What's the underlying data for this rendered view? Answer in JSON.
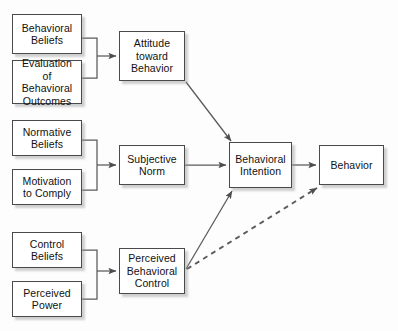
{
  "diagram": {
    "canvas": {
      "width": 398,
      "height": 331,
      "background": "#fdfdfd"
    },
    "style": {
      "box_border_color": "#4a4a4a",
      "box_fill": "#ffffff",
      "edge_color": "#555555",
      "text_color": "#111111",
      "shadow_color": "#969696"
    },
    "nodes": [
      {
        "id": "behavioral-beliefs",
        "label": "Behavioral\nBeliefs",
        "line1": "Behavioral",
        "line2": "Beliefs",
        "line3": "",
        "x": 12,
        "y": 14,
        "w": 70,
        "h": 40
      },
      {
        "id": "evaluation-of-behavioral-outcomes",
        "label": "Evaluation of\nBehavioral\nOutcomes",
        "line1": "Evaluation of",
        "line2": "Behavioral",
        "line3": "Outcomes",
        "x": 12,
        "y": 60,
        "w": 70,
        "h": 44
      },
      {
        "id": "attitude-toward-behavior",
        "label": "Attitude\ntoward\nBehavior",
        "line1": "Attitude",
        "line2": "toward",
        "line3": "Behavior",
        "x": 119,
        "y": 31,
        "w": 66,
        "h": 50
      },
      {
        "id": "normative-beliefs",
        "label": "Normative\nBeliefs",
        "line1": "Normative",
        "line2": "Beliefs",
        "line3": "",
        "x": 12,
        "y": 120,
        "w": 70,
        "h": 36
      },
      {
        "id": "motivation-to-comply",
        "label": "Motivation\nto Comply",
        "line1": "Motivation",
        "line2": "to Comply",
        "line3": "",
        "x": 12,
        "y": 169,
        "w": 70,
        "h": 36
      },
      {
        "id": "subjective-norm",
        "label": "Subjective\nNorm",
        "line1": "Subjective",
        "line2": "Norm",
        "line3": "",
        "x": 119,
        "y": 145,
        "w": 66,
        "h": 40
      },
      {
        "id": "control-beliefs",
        "label": "Control\nBeliefs",
        "line1": "Control",
        "line2": "Beliefs",
        "line3": "",
        "x": 12,
        "y": 232,
        "w": 70,
        "h": 36
      },
      {
        "id": "perceived-power",
        "label": "Perceived\nPower",
        "line1": "Perceived",
        "line2": "Power",
        "line3": "",
        "x": 12,
        "y": 281,
        "w": 70,
        "h": 36
      },
      {
        "id": "perceived-behavioral-control",
        "label": "Perceived\nBehavioral\nControl",
        "line1": "Perceived",
        "line2": "Behavioral",
        "line3": "Control",
        "x": 119,
        "y": 248,
        "w": 66,
        "h": 46
      },
      {
        "id": "behavioral-intention",
        "label": "Behavioral\nIntention",
        "line1": "Behavioral",
        "line2": "Intention",
        "line3": "",
        "x": 229,
        "y": 142,
        "w": 63,
        "h": 46
      },
      {
        "id": "behavior",
        "label": "Behavior",
        "line1": "Behavior",
        "line2": "",
        "line3": "",
        "x": 319,
        "y": 145,
        "w": 65,
        "h": 40
      }
    ],
    "edges": [
      {
        "id": "behavioral-beliefs-to-attitude",
        "from": "behavioral-beliefs",
        "to": "attitude-toward-behavior",
        "style": "solid",
        "arrowhead": true
      },
      {
        "id": "evaluation-to-attitude",
        "from": "evaluation-of-behavioral-outcomes",
        "to": "attitude-toward-behavior",
        "style": "solid",
        "arrowhead": true
      },
      {
        "id": "normative-beliefs-to-subjective-norm",
        "from": "normative-beliefs",
        "to": "subjective-norm",
        "style": "solid",
        "arrowhead": true
      },
      {
        "id": "motivation-to-subjective-norm",
        "from": "motivation-to-comply",
        "to": "subjective-norm",
        "style": "solid",
        "arrowhead": true
      },
      {
        "id": "control-beliefs-to-pbc",
        "from": "control-beliefs",
        "to": "perceived-behavioral-control",
        "style": "solid",
        "arrowhead": true
      },
      {
        "id": "perceived-power-to-pbc",
        "from": "perceived-power",
        "to": "perceived-behavioral-control",
        "style": "solid",
        "arrowhead": true
      },
      {
        "id": "attitude-to-intention",
        "from": "attitude-toward-behavior",
        "to": "behavioral-intention",
        "style": "solid",
        "arrowhead": true
      },
      {
        "id": "subjective-norm-to-intention",
        "from": "subjective-norm",
        "to": "behavioral-intention",
        "style": "solid",
        "arrowhead": true
      },
      {
        "id": "pbc-to-intention",
        "from": "perceived-behavioral-control",
        "to": "behavioral-intention",
        "style": "solid",
        "arrowhead": true
      },
      {
        "id": "intention-to-behavior",
        "from": "behavioral-intention",
        "to": "behavior",
        "style": "solid",
        "arrowhead": true
      },
      {
        "id": "pbc-to-behavior",
        "from": "perceived-behavioral-control",
        "to": "behavior",
        "style": "dashed",
        "arrowhead": true
      }
    ]
  }
}
